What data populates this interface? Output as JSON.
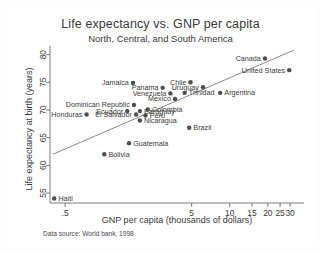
{
  "chart_data": {
    "type": "scatter",
    "title": "Life expectancy vs. GNP per capita",
    "subtitle": "North, Central, and South America",
    "xlabel": "GNP per capita (thousands of dollars)",
    "ylabel": "Life expectancy at birth (years)",
    "note": "Data source:  World bank, 1998",
    "xscale": "log",
    "xlim": [
      0.38,
      34
    ],
    "ylim": [
      53.2,
      81.2
    ],
    "xticks": [
      ".5",
      "5",
      "10",
      "15",
      "20",
      "25",
      "30"
    ],
    "xtick_values": [
      0.5,
      5,
      10,
      15,
      20,
      25,
      30
    ],
    "yticks": [
      "55",
      "60",
      "65",
      "70",
      "75",
      "80"
    ],
    "ytick_values": [
      55,
      60,
      65,
      70,
      75,
      80
    ],
    "grid": false,
    "legend": "none",
    "marker_color": "#4d4d4d",
    "fitline_color": "#8a8a8a",
    "fitline": {
      "x0": 0.4,
      "y0": 62.0,
      "x1": 32.0,
      "y1": 80.8
    },
    "points": [
      {
        "name": "Canada",
        "x": 19.0,
        "y": 79.3,
        "label_side": "left"
      },
      {
        "name": "United States",
        "x": 29.5,
        "y": 77.2,
        "label_side": "left"
      },
      {
        "name": "Jamaica",
        "x": 1.72,
        "y": 74.9,
        "label_side": "left"
      },
      {
        "name": "Chile",
        "x": 4.9,
        "y": 75.0,
        "label_side": "left"
      },
      {
        "name": "Panama",
        "x": 2.95,
        "y": 74.0,
        "label_side": "left"
      },
      {
        "name": "Uruguay",
        "x": 6.15,
        "y": 74.1,
        "label_side": "left"
      },
      {
        "name": "Venezuela",
        "x": 3.4,
        "y": 73.0,
        "label_side": "left"
      },
      {
        "name": "Trinidad",
        "x": 4.4,
        "y": 73.1,
        "label_side": "right"
      },
      {
        "name": "Argentina",
        "x": 8.4,
        "y": 73.1,
        "label_side": "right"
      },
      {
        "name": "Mexico",
        "x": 3.7,
        "y": 72.0,
        "label_side": "left"
      },
      {
        "name": "Dominican Republic",
        "x": 1.75,
        "y": 70.9,
        "label_side": "left"
      },
      {
        "name": "Ecuador",
        "x": 1.55,
        "y": 69.8,
        "label_side": "left"
      },
      {
        "name": "Paraguay",
        "x": 1.95,
        "y": 69.8,
        "label_side": "right"
      },
      {
        "name": "Colombia",
        "x": 2.25,
        "y": 70.1,
        "label_side": "right"
      },
      {
        "name": "Honduras",
        "x": 0.74,
        "y": 69.2,
        "label_side": "left"
      },
      {
        "name": "El Salvador",
        "x": 1.82,
        "y": 69.2,
        "label_side": "left"
      },
      {
        "name": "Peru",
        "x": 2.16,
        "y": 69.0,
        "label_side": "right"
      },
      {
        "name": "Nicaragua",
        "x": 1.95,
        "y": 68.1,
        "label_side": "right"
      },
      {
        "name": "Brazil",
        "x": 4.78,
        "y": 66.8,
        "label_side": "right"
      },
      {
        "name": "Guatemala",
        "x": 1.6,
        "y": 64.0,
        "label_side": "right"
      },
      {
        "name": "Bolivia",
        "x": 1.02,
        "y": 62.0,
        "label_side": "right"
      },
      {
        "name": "Haiti",
        "x": 0.41,
        "y": 54.0,
        "label_side": "right"
      }
    ]
  }
}
